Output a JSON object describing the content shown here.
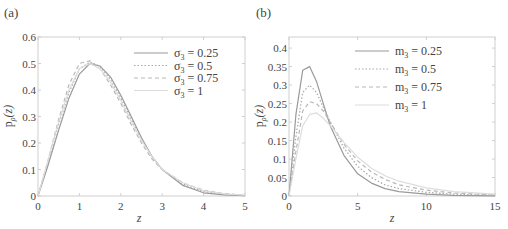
{
  "chart_data": [
    {
      "panel": "(a)",
      "type": "line",
      "title": "",
      "xlabel": "z",
      "ylabel": "p_ρ(z)",
      "xlim": [
        0,
        5
      ],
      "ylim": [
        0,
        0.6
      ],
      "xticks": [
        0,
        1,
        2,
        3,
        4,
        5
      ],
      "yticks": [
        0,
        0.1,
        0.2,
        0.3,
        0.4,
        0.5,
        0.6
      ],
      "ytick_labels": [
        "0",
        "0.1",
        "0.2",
        "0.3",
        "0.4",
        "0.5",
        "0.6"
      ],
      "grid": false,
      "legend_position": "upper right",
      "x": [
        0,
        0.25,
        0.5,
        0.75,
        1,
        1.25,
        1.5,
        1.75,
        2,
        2.25,
        2.5,
        2.75,
        3,
        3.5,
        4,
        4.5,
        5
      ],
      "series": [
        {
          "name": "σ3 = 0.25",
          "style": "solid",
          "color": "#9a9a9a",
          "values": [
            0,
            0.12,
            0.25,
            0.37,
            0.46,
            0.5,
            0.49,
            0.45,
            0.38,
            0.3,
            0.22,
            0.15,
            0.1,
            0.04,
            0.012,
            0.004,
            0.001
          ]
        },
        {
          "name": "σ3 = 0.5",
          "style": "dotted",
          "color": "#a8a8a8",
          "values": [
            0,
            0.13,
            0.27,
            0.39,
            0.48,
            0.505,
            0.49,
            0.44,
            0.37,
            0.29,
            0.21,
            0.15,
            0.1,
            0.045,
            0.017,
            0.006,
            0.002
          ]
        },
        {
          "name": "σ3 = 0.75",
          "style": "dashed",
          "color": "#b8b8b8",
          "values": [
            0,
            0.14,
            0.29,
            0.42,
            0.5,
            0.51,
            0.48,
            0.42,
            0.35,
            0.27,
            0.2,
            0.14,
            0.1,
            0.05,
            0.022,
            0.009,
            0.003
          ]
        },
        {
          "name": "σ3 = 1",
          "style": "solid",
          "color": "#dddddd",
          "values": [
            0,
            0.14,
            0.28,
            0.4,
            0.48,
            0.5,
            0.48,
            0.43,
            0.36,
            0.28,
            0.21,
            0.15,
            0.1,
            0.05,
            0.02,
            0.008,
            0.003
          ]
        }
      ]
    },
    {
      "panel": "(b)",
      "type": "line",
      "title": "",
      "xlabel": "z",
      "ylabel": "p_ρ(z)",
      "xlim": [
        0,
        15
      ],
      "ylim": [
        0,
        0.43
      ],
      "xticks": [
        0,
        5,
        10,
        15
      ],
      "yticks": [
        0,
        0.05,
        0.1,
        0.15,
        0.2,
        0.25,
        0.3,
        0.35,
        0.4
      ],
      "ytick_labels": [
        "0",
        "0.05",
        "0.1",
        "0.15",
        "0.2",
        "0.25",
        "0.3",
        "0.35",
        "0.4"
      ],
      "grid": false,
      "legend_position": "upper right",
      "x": [
        0,
        0.5,
        1,
        1.5,
        2,
        2.5,
        3,
        4,
        5,
        6,
        7,
        8,
        10,
        12,
        15
      ],
      "series": [
        {
          "name": "m3 = 0.25",
          "style": "solid",
          "color": "#9a9a9a",
          "values": [
            0,
            0.22,
            0.34,
            0.35,
            0.31,
            0.25,
            0.19,
            0.11,
            0.06,
            0.035,
            0.02,
            0.012,
            0.005,
            0.002,
            0.0005
          ]
        },
        {
          "name": "m3 = 0.5",
          "style": "dotted",
          "color": "#a8a8a8",
          "values": [
            0,
            0.16,
            0.28,
            0.3,
            0.28,
            0.24,
            0.2,
            0.13,
            0.08,
            0.05,
            0.03,
            0.02,
            0.01,
            0.005,
            0.002
          ]
        },
        {
          "name": "m3 = 0.75",
          "style": "dashed",
          "color": "#b8b8b8",
          "values": [
            0,
            0.12,
            0.23,
            0.255,
            0.25,
            0.23,
            0.2,
            0.14,
            0.095,
            0.065,
            0.045,
            0.03,
            0.016,
            0.008,
            0.003
          ]
        },
        {
          "name": "m3 = 1",
          "style": "solid",
          "color": "#dddddd",
          "values": [
            0,
            0.1,
            0.19,
            0.22,
            0.225,
            0.21,
            0.19,
            0.145,
            0.105,
            0.075,
            0.055,
            0.04,
            0.022,
            0.012,
            0.005
          ]
        }
      ]
    }
  ],
  "panels": {
    "a": {
      "label": "(a)",
      "xlabel": "z",
      "ylabel_main": "p",
      "ylabel_sub": "ρ",
      "ylabel_arg": "(z)",
      "legend": [
        {
          "sym": "σ",
          "sub": "3",
          "text": " = 0.25"
        },
        {
          "sym": "σ",
          "sub": "3",
          "text": " = 0.5"
        },
        {
          "sym": "σ",
          "sub": "3",
          "text": " = 0.75"
        },
        {
          "sym": "σ",
          "sub": "3",
          "text": " = 1"
        }
      ]
    },
    "b": {
      "label": "(b)",
      "xlabel": "z",
      "ylabel_main": "p",
      "ylabel_sub": "ρ",
      "ylabel_arg": "(z)",
      "legend": [
        {
          "sym": "m",
          "sub": "3",
          "text": " = 0.25"
        },
        {
          "sym": "m",
          "sub": "3",
          "text": " = 0.5"
        },
        {
          "sym": "m",
          "sub": "3",
          "text": " = 0.75"
        },
        {
          "sym": "m",
          "sub": "3",
          "text": " = 1"
        }
      ]
    }
  }
}
